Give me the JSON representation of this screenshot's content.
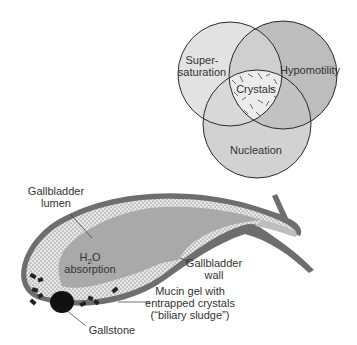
{
  "venn": {
    "circles": [
      {
        "id": "supersaturation",
        "label_lines": [
          "Super-",
          "saturation"
        ],
        "fill": "#e2e2e2"
      },
      {
        "id": "hypomotility",
        "label_lines": [
          "Hypomotility"
        ],
        "fill": "#bdbdbd"
      },
      {
        "id": "nucleation",
        "label_lines": [
          "Nucleation"
        ],
        "fill": "#d2d2d2"
      }
    ],
    "center_label": "Crystals",
    "colors": {
      "stroke": "#2a2a2a",
      "overlap": "#c8c8c8",
      "center": "#e8e8e8"
    }
  },
  "gallbladder": {
    "labels": {
      "lumen_line1": "Gallbladder",
      "lumen_line2": "lumen",
      "h2o_main": "H",
      "h2o_sub": "2",
      "h2o_end": "O",
      "absorption": "absorption",
      "wall_line1": "Gallbladder",
      "wall_line2": "wall",
      "mucin_line1": "Mucin gel with",
      "mucin_line2": "entrapped crystals",
      "mucin_line3": "(“biliary sludge”)",
      "gallstone": "Gallstone"
    },
    "colors": {
      "wall": "#6e6e6e",
      "sludge": "#e6e6e6",
      "lumen": "#a9a9a9",
      "stone": "#111111"
    }
  }
}
